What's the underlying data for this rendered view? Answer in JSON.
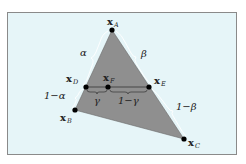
{
  "figure": {
    "points": {
      "A": {
        "label": "x",
        "sub": "A"
      },
      "B": {
        "label": "x",
        "sub": "B"
      },
      "C": {
        "label": "x",
        "sub": "C"
      },
      "D": {
        "label": "x",
        "sub": "D"
      },
      "E": {
        "label": "x",
        "sub": "E"
      },
      "F": {
        "label": "x",
        "sub": "F"
      }
    },
    "braces": {
      "alpha": "α",
      "one_minus_alpha": "1−α",
      "beta": "β",
      "one_minus_beta": "1−β",
      "gamma": "γ",
      "one_minus_gamma": "1−γ"
    },
    "colors": {
      "background": "#e6f5f8",
      "triangle_fill": "#8f8f8f",
      "point": "#000000",
      "border": "#8a8a8a"
    }
  }
}
